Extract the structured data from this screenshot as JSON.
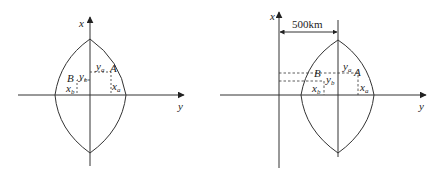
{
  "colors": {
    "stroke": "#333333",
    "background": "#ffffff"
  },
  "left_figure": {
    "axis_x_label": "x",
    "axis_y_label": "y",
    "point_a_label": "A",
    "point_b_label": "B",
    "ya": {
      "base": "y",
      "sub": "a"
    },
    "yb": {
      "base": "y",
      "sub": "b"
    },
    "xa": {
      "base": "x",
      "sub": "a"
    },
    "xb": {
      "base": "x",
      "sub": "b"
    }
  },
  "right_figure": {
    "axis_x_label": "x",
    "axis_y_label": "y",
    "distance_label": "500km",
    "point_a_label": "A",
    "point_b_label": "B",
    "ya": {
      "base": "y",
      "sub": "a"
    },
    "yb": {
      "base": "y",
      "sub": "b"
    },
    "xa": {
      "base": "x",
      "sub": "a"
    },
    "xb": {
      "base": "x",
      "sub": "b"
    }
  }
}
